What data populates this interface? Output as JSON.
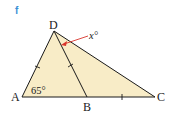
{
  "part_label": "f",
  "vertices": {
    "A": {
      "label": "A",
      "x": 22,
      "y": 97
    },
    "B": {
      "label": "B",
      "x": 87,
      "y": 97
    },
    "C": {
      "label": "C",
      "x": 155,
      "y": 97
    },
    "D": {
      "label": "D",
      "x": 54,
      "y": 31
    }
  },
  "angles": {
    "A": "65°",
    "x": "x°"
  },
  "colors": {
    "fill": "#f8ecc7",
    "stroke": "#1a1a1a",
    "arrow": "#d9342b",
    "part_label": "#3b8fd6"
  }
}
